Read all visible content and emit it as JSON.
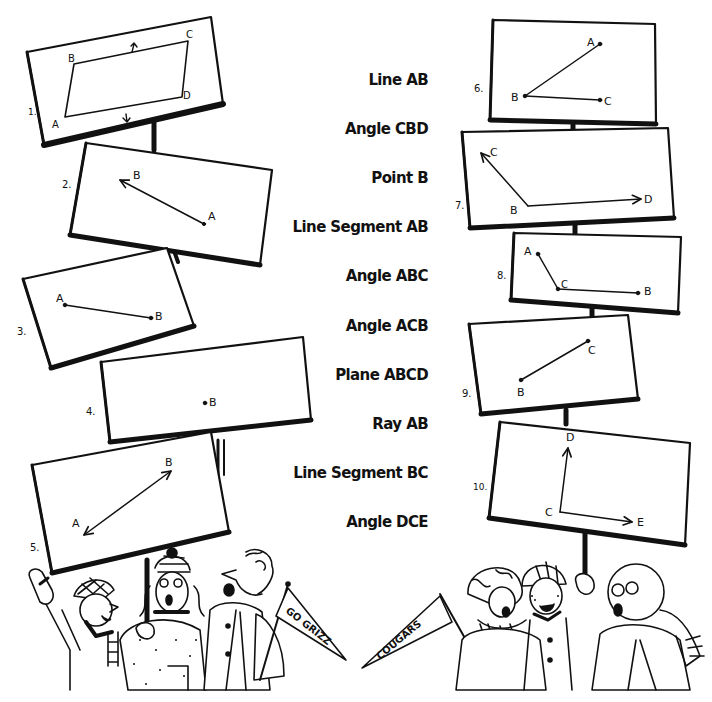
{
  "terms": [
    {
      "label": "Line AB",
      "y": 80
    },
    {
      "label": "Angle CBD",
      "y": 129
    },
    {
      "label": "Point B",
      "y": 178
    },
    {
      "label": "Line Segment AB",
      "y": 227
    },
    {
      "label": "Angle ABC",
      "y": 276
    },
    {
      "label": "Angle ACB",
      "y": 326
    },
    {
      "label": "Plane ABCD",
      "y": 375
    },
    {
      "label": "Ray AB",
      "y": 424
    },
    {
      "label": "Line Segment BC",
      "y": 473
    },
    {
      "label": "Angle DCE",
      "y": 522
    }
  ],
  "signs": [
    {
      "number": "1.",
      "figure": "plane",
      "points": [
        "A",
        "B",
        "C",
        "D"
      ]
    },
    {
      "number": "2.",
      "figure": "ray",
      "points": [
        "A",
        "B"
      ]
    },
    {
      "number": "3.",
      "figure": "segment",
      "points": [
        "A",
        "B"
      ]
    },
    {
      "number": "4.",
      "figure": "point",
      "points": [
        "B"
      ]
    },
    {
      "number": "5.",
      "figure": "line",
      "points": [
        "A",
        "B"
      ]
    },
    {
      "number": "6.",
      "figure": "angle",
      "points": [
        "A",
        "B",
        "C"
      ]
    },
    {
      "number": "7.",
      "figure": "angle-rays",
      "points": [
        "C",
        "B",
        "D"
      ]
    },
    {
      "number": "8.",
      "figure": "angle",
      "points": [
        "A",
        "C",
        "B"
      ]
    },
    {
      "number": "9.",
      "figure": "segment",
      "points": [
        "B",
        "C"
      ]
    },
    {
      "number": "10.",
      "figure": "angle-rays",
      "points": [
        "D",
        "C",
        "E"
      ]
    }
  ],
  "pennants": {
    "left": "GO GRIZZ",
    "right": "COUGARS"
  },
  "colors": {
    "ink": "#111111",
    "paper": "#ffffff"
  }
}
